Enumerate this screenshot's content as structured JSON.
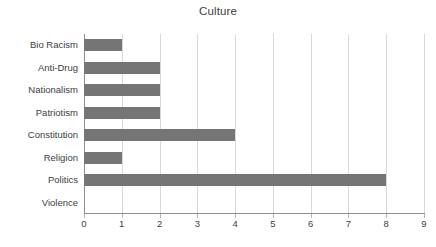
{
  "chart_data": {
    "type": "bar",
    "orientation": "horizontal",
    "title": "Culture",
    "xlabel": "",
    "ylabel": "",
    "categories": [
      "Bio Racism",
      "Anti-Drug",
      "Nationalism",
      "Patriotism",
      "Constitution",
      "Religion",
      "Politics",
      "Violence"
    ],
    "values": [
      1,
      2,
      2,
      2,
      4,
      1,
      8,
      0
    ],
    "xlim": [
      0,
      9
    ],
    "xticks": [
      0,
      1,
      2,
      3,
      4,
      5,
      6,
      7,
      8,
      9
    ],
    "xticklabels": [
      "0",
      "1",
      "2",
      "3",
      "4",
      "5",
      "6",
      "7",
      "8",
      "9"
    ],
    "grid": "vertical",
    "legend": "none",
    "bar_color": "#757575",
    "gridline_color": "#d9d9d9",
    "axis_color": "#8f8f8f"
  },
  "caption": {
    "sliver_text": ""
  }
}
